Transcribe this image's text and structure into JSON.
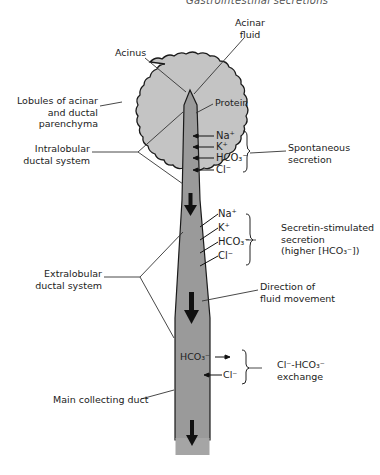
{
  "header": {
    "running_title": "Gastrointestinal secretions",
    "page_number": "?"
  },
  "diagram": {
    "colors": {
      "lobule_fill": "#c4c4c4",
      "duct_fill": "#9a9a9a",
      "outline": "#1a1a1a",
      "arrow": "#111111"
    },
    "labels": {
      "acinus": "Acinus",
      "acinar_fluid_1": "Acinar",
      "acinar_fluid_2": "fluid",
      "lobules_1": "Lobules of acinar",
      "lobules_2": "and ductal",
      "lobules_3": "parenchyma",
      "protein": "Protein",
      "intralobular_1": "Intralobular",
      "intralobular_2": "ductal system",
      "spontaneous_1": "Spontaneous",
      "spontaneous_2": "secretion",
      "secretin_1": "Secretin-stimulated",
      "secretin_2": "secretion",
      "secretin_3": "(higher [HCO₃⁻])",
      "extralobular_1": "Extralobular",
      "extralobular_2": "ductal system",
      "direction_1": "Direction of",
      "direction_2": "fluid movement",
      "exchange_1": "Cl⁻-HCO₃⁻",
      "exchange_2": "exchange",
      "main_duct": "Main collecting duct"
    },
    "spontaneous_ions": [
      "Na⁺",
      "K⁺",
      "HCO₃⁻",
      "Cl⁻"
    ],
    "secretin_ions": [
      "Na⁺",
      "K⁺",
      "HCO₃⁻",
      "Cl⁻"
    ],
    "exchange_ions": {
      "out": "HCO₃⁻",
      "in": "Cl⁻"
    }
  }
}
